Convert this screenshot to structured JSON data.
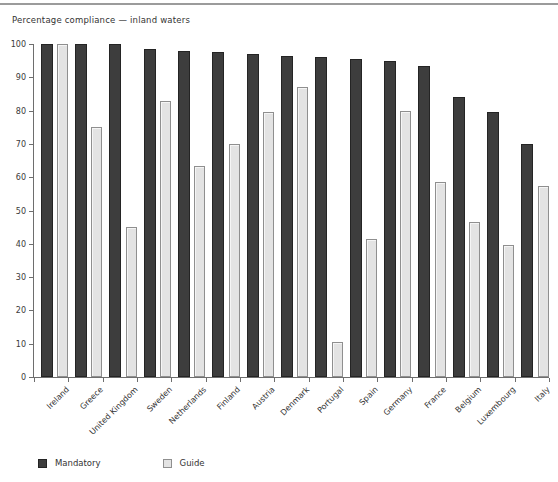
{
  "chart_data": {
    "type": "bar",
    "title": "Percentage compliance — inland waters",
    "categories": [
      "Ireland",
      "Greece",
      "United Kingdom",
      "Sweden",
      "Netherlands",
      "Finland",
      "Austria",
      "Denmark",
      "Portugal",
      "Spain",
      "Germany",
      "France",
      "Belgium",
      "Luxembourg",
      "Italy"
    ],
    "series": [
      {
        "name": "Mandatory",
        "color": "#3d3d3d",
        "values": [
          100,
          100,
          100,
          98.5,
          98,
          97.5,
          97,
          96.5,
          96,
          95.5,
          95,
          93.5,
          84,
          79.5,
          70
        ]
      },
      {
        "name": "Guide",
        "color": "#e3e3e3",
        "values": [
          100,
          75,
          45,
          83,
          63.5,
          70,
          79.5,
          87,
          10.5,
          41.5,
          80,
          58.5,
          46.5,
          39.5,
          57.5
        ]
      }
    ],
    "xlabel": "",
    "ylabel": "",
    "ylim": [
      0,
      100
    ],
    "ytick_step": 10,
    "yticks": [
      "0",
      "10",
      "20",
      "30",
      "40",
      "50",
      "60",
      "70",
      "80",
      "90",
      "100"
    ],
    "grid": false,
    "legend_position": "bottom-left",
    "axis_color": "#6e6e6e",
    "background": "#ffffff"
  }
}
